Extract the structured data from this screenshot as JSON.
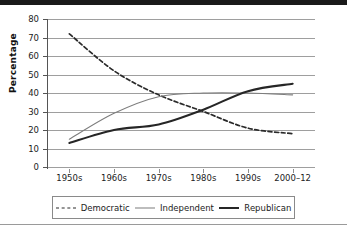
{
  "chart_data": {
    "type": "line",
    "title": "",
    "xlabel": "",
    "ylabel": "Percentage",
    "ylim": [
      0,
      80
    ],
    "yticks": [
      0,
      10,
      20,
      30,
      40,
      50,
      60,
      70,
      80
    ],
    "grid": true,
    "legend_position": "bottom",
    "categories": [
      "1950s",
      "1960s",
      "1970s",
      "1980s",
      "1990s",
      "2000–12"
    ],
    "series": [
      {
        "name": "Democratic",
        "style": "dashed",
        "color": "#2a2a2a",
        "values": [
          72,
          52,
          39,
          30,
          21,
          18
        ]
      },
      {
        "name": "Independent",
        "style": "solid-thin",
        "color": "#7d7d7d",
        "values": [
          15,
          29,
          38,
          40,
          40,
          39
        ]
      },
      {
        "name": "Republican",
        "style": "solid-thick",
        "color": "#262626",
        "values": [
          13,
          20,
          23,
          31,
          41,
          45
        ]
      }
    ]
  },
  "legend": {
    "items": [
      {
        "label": "Democratic"
      },
      {
        "label": "Independent"
      },
      {
        "label": "Republican"
      }
    ]
  },
  "colors": {
    "democratic": "#2a2a2a",
    "independent": "#7d7d7d",
    "republican": "#262626",
    "gridline": "#9e9e9e",
    "axis": "#555555",
    "top_bar": "#1a1a1a",
    "background": "#ffffff"
  }
}
